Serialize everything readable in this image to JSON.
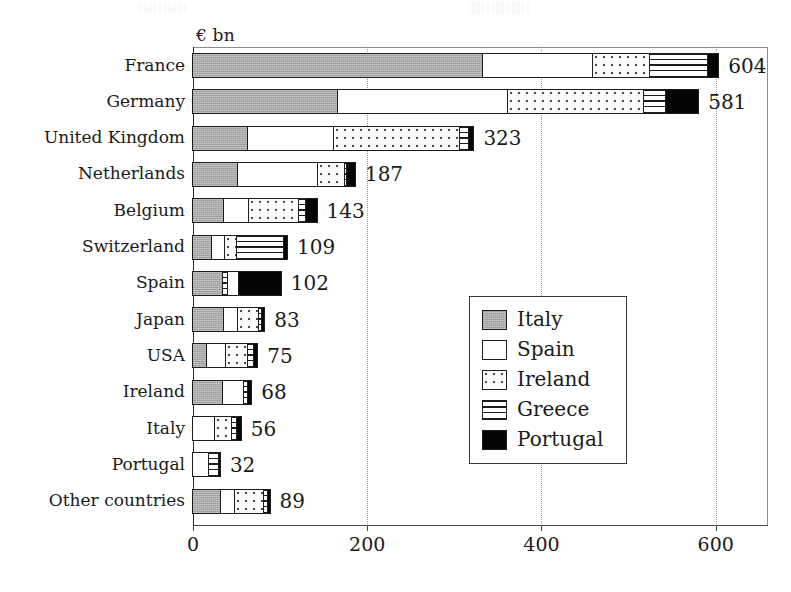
{
  "chart_data": {
    "type": "bar",
    "orientation": "horizontal",
    "stacked": true,
    "title": "",
    "xlabel": "",
    "ylabel": "",
    "axis_unit_label": "€ bn",
    "xlim": [
      0,
      660
    ],
    "xticks": [
      0,
      200,
      400,
      600
    ],
    "xtick_labels": [
      "0",
      "200",
      "400",
      "600"
    ],
    "grid": "vertical-dotted",
    "legend_position": "middle-right",
    "series": [
      {
        "name": "Italy",
        "values": [
          333,
          167,
          63,
          52,
          36,
          22,
          34,
          36,
          16,
          35,
          0,
          0,
          32
        ]
      },
      {
        "name": "Spain",
        "values": [
          126,
          195,
          99,
          92,
          28,
          15,
          13,
          16,
          22,
          23,
          25,
          18,
          16
        ]
      },
      {
        "name": "Ireland",
        "values": [
          66,
          156,
          145,
          30,
          58,
          13,
          0,
          24,
          25,
          0,
          20,
          0,
          34
        ]
      },
      {
        "name": "Greece",
        "values": [
          66,
          25,
          10,
          3,
          8,
          55,
          6,
          3,
          7,
          5,
          5,
          12,
          4
        ]
      },
      {
        "name": "Portugal",
        "values": [
          13,
          38,
          6,
          10,
          13,
          4,
          49,
          4,
          5,
          5,
          6,
          2,
          3
        ]
      }
    ],
    "categories": [
      "France",
      "Germany",
      "United Kingdom",
      "Netherlands",
      "Belgium",
      "Switzerland",
      "Spain",
      "Japan",
      "USA",
      "Ireland",
      "Italy",
      "Portugal",
      "Other countries"
    ],
    "totals": [
      604,
      581,
      323,
      187,
      143,
      109,
      102,
      83,
      75,
      68,
      56,
      32,
      89
    ],
    "total_labels": [
      "604",
      "581",
      "323",
      "187",
      "143",
      "109",
      "102",
      "83",
      "75",
      "68",
      "56",
      "32",
      "89"
    ],
    "segment_orders": [
      [
        "italy",
        "spain",
        "ireland",
        "greece",
        "portugal"
      ],
      [
        "italy",
        "spain",
        "ireland",
        "greece",
        "portugal"
      ],
      [
        "italy",
        "spain",
        "ireland",
        "greece",
        "portugal"
      ],
      [
        "italy",
        "spain",
        "ireland",
        "greece",
        "portugal"
      ],
      [
        "italy",
        "spain",
        "ireland",
        "greece",
        "portugal"
      ],
      [
        "italy",
        "spain",
        "ireland",
        "greece",
        "portugal"
      ],
      [
        "italy",
        "greece",
        "spain",
        "portugal"
      ],
      [
        "italy",
        "spain",
        "ireland",
        "greece",
        "portugal"
      ],
      [
        "italy",
        "spain",
        "ireland",
        "greece",
        "portugal"
      ],
      [
        "italy",
        "spain",
        "greece",
        "portugal"
      ],
      [
        "spain",
        "ireland",
        "greece",
        "portugal"
      ],
      [
        "spain",
        "greece",
        "portugal"
      ],
      [
        "italy",
        "spain",
        "ireland",
        "greece",
        "portugal"
      ]
    ],
    "colors": {
      "Italy": "#a8a8a8",
      "Spain": "#ffffff",
      "Ireland": "#fbfbfb",
      "Greece": "#ffffff",
      "Portugal": "#050505"
    }
  },
  "legend": {
    "items": [
      {
        "label": "Italy",
        "pattern": "solid-gray"
      },
      {
        "label": "Spain",
        "pattern": "solid-white"
      },
      {
        "label": "Ireland",
        "pattern": "dotted"
      },
      {
        "label": "Greece",
        "pattern": "horizontal-lines"
      },
      {
        "label": "Portugal",
        "pattern": "solid-black"
      }
    ]
  }
}
